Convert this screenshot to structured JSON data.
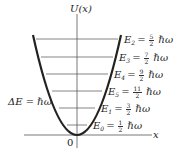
{
  "figure": {
    "y_axis_label": "U(x)",
    "x_axis_label": "x",
    "origin_label": "0",
    "spacing_label": "ΔE = ℏω",
    "unit": "ℏω",
    "levels_top_to_bottom": [
      {
        "label": "E",
        "sub": "2",
        "num": "5",
        "den": "2"
      },
      {
        "label": "E",
        "sub": "3",
        "num": "7",
        "den": "2"
      },
      {
        "label": "E",
        "sub": "4",
        "num": "9",
        "den": "2"
      },
      {
        "label": "E",
        "sub": "5",
        "num": "11",
        "den": "2"
      },
      {
        "label": "E",
        "sub": "1",
        "num": "3",
        "den": "2"
      },
      {
        "label": "E",
        "sub": "0",
        "num": "1",
        "den": "2"
      }
    ]
  },
  "notes": {
    "label_order_discrepancy": "Level labels are reproduced exactly as printed in the source image. Their subscripts and values are not monotonic with height: the top line reads E2 = 5/2 ħω while lower lines read 7/2, 9/2, 11/2 ħω. For a quantum harmonic oscillator En = (n + 1/2)ħω, so from top to bottom the levels should be E5 = 11/2, E4 = 9/2, E3 = 7/2, E2 = 5/2, E1 = 3/2, E0 = 1/2 ħω."
  }
}
